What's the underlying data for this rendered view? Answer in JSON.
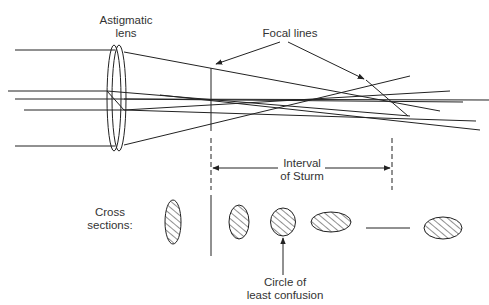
{
  "labels": {
    "lens_line1": "Astigmatic",
    "lens_line2": "lens",
    "focal_lines": "Focal lines",
    "interval_line1": "Interval",
    "interval_line2": "of Sturm",
    "cross_line1": "Cross",
    "cross_line2": "sections:",
    "circle_line1": "Circle of",
    "circle_line2": "least confusion"
  },
  "colors": {
    "stroke": "#222222",
    "text": "#333333",
    "background": "#ffffff"
  }
}
